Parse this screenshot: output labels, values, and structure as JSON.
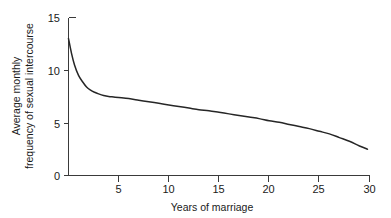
{
  "chart_data": {
    "type": "line",
    "title": "",
    "subtitle": "",
    "xlabel": "Years of marriage",
    "ylabel_line1": "Average monthly",
    "ylabel_line2": "frequency of sexual intercourse",
    "ylabel": "Average monthly frequency of sexual intercourse",
    "xlim": [
      0,
      30
    ],
    "ylim": [
      0,
      15
    ],
    "xticks": [
      5,
      10,
      15,
      20,
      25,
      30
    ],
    "xticklabels": [
      "5",
      "10",
      "15",
      "20",
      "25",
      "30"
    ],
    "yticks": [
      0,
      5,
      10,
      15
    ],
    "yticklabels": [
      "0",
      "5",
      "10",
      "15"
    ],
    "grid": false,
    "legend": false,
    "legend_position": "none",
    "line_color": "#262626",
    "axis_color": "#3a3a3a",
    "background_color": "#ffffff",
    "series": [
      {
        "name": "Average monthly frequency of sexual intercourse",
        "x": [
          0.0,
          0.3,
          0.6,
          1.0,
          1.4,
          1.8,
          2.2,
          2.6,
          3.0,
          3.5,
          4.0,
          4.5,
          5.0,
          6.0,
          7.0,
          8.0,
          9.0,
          10.0,
          11.0,
          12.0,
          13.0,
          14.0,
          15.0,
          16.0,
          17.0,
          18.0,
          19.0,
          20.0,
          21.0,
          22.0,
          23.0,
          24.0,
          25.0,
          26.0,
          27.0,
          28.0,
          29.0,
          29.8
        ],
        "y": [
          13.0,
          11.6,
          10.5,
          9.5,
          8.9,
          8.4,
          8.1,
          7.9,
          7.75,
          7.6,
          7.5,
          7.45,
          7.4,
          7.3,
          7.15,
          7.0,
          6.85,
          6.7,
          6.55,
          6.4,
          6.25,
          6.15,
          6.0,
          5.85,
          5.7,
          5.55,
          5.4,
          5.2,
          5.05,
          4.85,
          4.65,
          4.45,
          4.2,
          3.95,
          3.6,
          3.25,
          2.8,
          2.5
        ]
      }
    ]
  },
  "figure": {
    "caption": ""
  }
}
